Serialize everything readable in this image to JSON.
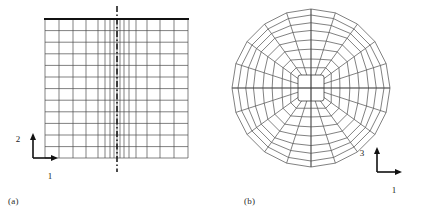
{
  "figure": {
    "background": "#ffffff",
    "line_color": "#4a4a4a",
    "bold_line_color": "#1a1a1a",
    "text_color": "#1a1a1a"
  },
  "panels": [
    {
      "id": "a",
      "caption": "(a)",
      "type": "structured-quadrilateral-mesh",
      "description": "Rectangular block mesh with vertical grid lines graded toward a vertical symmetry centerline",
      "axes": {
        "origin_label": "",
        "vertical_label": "2",
        "horizontal_label": "1"
      },
      "mesh": {
        "x_left": 45,
        "x_right": 188,
        "y_top": 19,
        "y_bottom": 158,
        "rows": 12,
        "row_lines_y": [
          19,
          30.6,
          42.2,
          53.8,
          65.4,
          77,
          88.6,
          100.2,
          111.8,
          123.4,
          135,
          146.6,
          158
        ],
        "column_lines_x": [
          45,
          59,
          73,
          86,
          98,
          105,
          110,
          114,
          117,
          120,
          124,
          129,
          136,
          147,
          160,
          174,
          188
        ],
        "centerline_x": 117,
        "centerline_style": "dash-dot",
        "centerline_top": 6,
        "centerline_bottom": 172,
        "top_edge_bold": true
      }
    },
    {
      "id": "b",
      "caption": "(b)",
      "type": "o-grid-mesh",
      "description": "Circular O-grid: square core block with inner cross, surrounded by concentric rings and radial spokes",
      "axes": {
        "origin_label": "",
        "vertical_label": "3",
        "horizontal_label": "1"
      },
      "mesh": {
        "center_x": 100,
        "center_y": 88,
        "core_half_size": 13,
        "core_inner_cross": true,
        "radial_spokes": 20,
        "rings": 8,
        "ring_radii": [
          22,
          31,
          41,
          50,
          59,
          66,
          73,
          79
        ],
        "outer_radius": 79,
        "shape_blend": "square core transitioning to circular outer boundary",
        "axis_cross_lines": true
      }
    }
  ],
  "axis_indicators": {
    "panel_a": {
      "vertical_label": "2",
      "horizontal_label": "1",
      "corner_x": 33,
      "corner_y": 158,
      "arm_length": 22
    },
    "panel_b": {
      "vertical_label": "3",
      "horizontal_label": "1",
      "corner_x": 166,
      "corner_y": 172,
      "arm_length": 22
    }
  }
}
